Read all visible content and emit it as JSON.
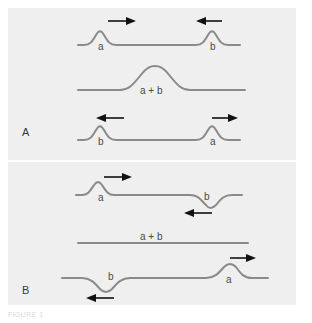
{
  "figure": {
    "caption": "FIGURE 1",
    "stroke_color": "#8a8a8a",
    "arrow_color": "#111111",
    "panel_background": "#efefef",
    "page_background": "#ffffff"
  },
  "panels": [
    {
      "label": "A",
      "type": "constructive-interference",
      "rows": [
        {
          "name": "before",
          "pulses": [
            {
              "label": "a",
              "direction": "right",
              "polarity": "up",
              "x": 100
            },
            {
              "label": "b",
              "direction": "left",
              "polarity": "up",
              "x": 212
            }
          ]
        },
        {
          "name": "during",
          "pulses": [
            {
              "label": "a + b",
              "direction": "none",
              "polarity": "up",
              "x": 155
            }
          ]
        },
        {
          "name": "after",
          "pulses": [
            {
              "label": "b",
              "direction": "left",
              "polarity": "up",
              "x": 100
            },
            {
              "label": "a",
              "direction": "right",
              "polarity": "up",
              "x": 212
            }
          ]
        }
      ]
    },
    {
      "label": "B",
      "type": "destructive-interference",
      "rows": [
        {
          "name": "before",
          "pulses": [
            {
              "label": "a",
              "direction": "right",
              "polarity": "up",
              "x": 95
            },
            {
              "label": "b",
              "direction": "left",
              "polarity": "down",
              "x": 215
            }
          ]
        },
        {
          "name": "during",
          "pulses": [
            {
              "label": "a + b",
              "direction": "none",
              "polarity": "flat",
              "x": 155
            }
          ]
        },
        {
          "name": "after",
          "pulses": [
            {
              "label": "b",
              "direction": "left",
              "polarity": "down",
              "x": 110
            },
            {
              "label": "a",
              "direction": "right",
              "polarity": "up",
              "x": 230
            }
          ]
        }
      ]
    }
  ],
  "labels": {
    "panel_a": "A",
    "panel_b": "B",
    "a": "a",
    "b": "b",
    "sum": "a + b"
  }
}
